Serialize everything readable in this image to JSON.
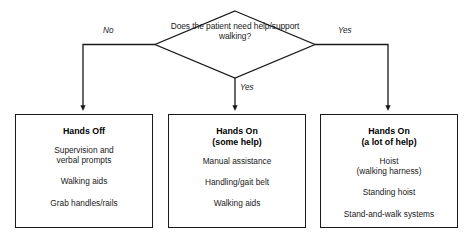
{
  "diagram": {
    "type": "decision-flowchart",
    "decision": {
      "question": "Does the patient\nneed help/support\nwalking?"
    },
    "edges": [
      {
        "id": "no-left",
        "label": "No"
      },
      {
        "id": "yes-middle",
        "label": "Yes"
      },
      {
        "id": "yes-right",
        "label": "Yes"
      }
    ],
    "outcomes": [
      {
        "id": "hands-off",
        "title": "Hands Off",
        "items": [
          "Supervision and\nverbal prompts",
          "Walking aids",
          "Grab handles/rails"
        ]
      },
      {
        "id": "hands-on-some",
        "title": "Hands On\n(some help)",
        "items": [
          "Manual assistance",
          "Handling/gait belt",
          "Walking aids"
        ]
      },
      {
        "id": "hands-on-alot",
        "title": "Hands On\n(a lot of help)",
        "items": [
          "Hoist\n(walking harness)",
          "Standing hoist",
          "Stand-and-walk systems"
        ]
      }
    ],
    "colors": {
      "stroke": "#1a1a1a",
      "background": "#ffffff",
      "text": "#1a1a1a"
    }
  }
}
